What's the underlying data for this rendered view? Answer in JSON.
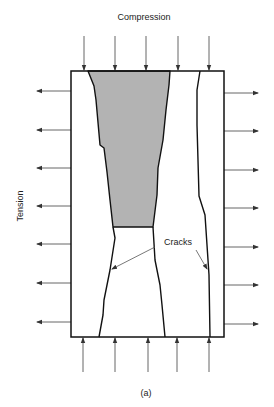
{
  "diagram": {
    "title_top": "Compression",
    "label_left": "Tension",
    "label_cracks": "Cracks",
    "caption": "(a)",
    "colors": {
      "outline": "#111111",
      "arrow": "#555555",
      "shaded_region": "#b3b3b3"
    },
    "compression_arrow_count": 5,
    "tension_arrow_count_per_side": 7
  }
}
